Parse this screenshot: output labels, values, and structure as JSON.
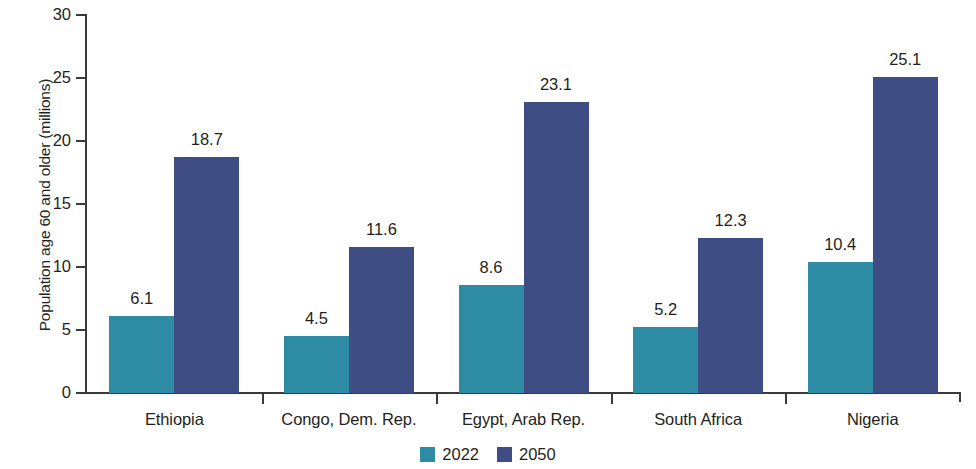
{
  "chart_data": {
    "type": "bar",
    "title": "",
    "subtitle": "",
    "xlabel": "",
    "ylabel": "Population age 60 and older (millions)",
    "categories": [
      "Ethiopia",
      "Congo, Dem. Rep.",
      "Egypt, Arab Rep.",
      "South Africa",
      "Nigeria"
    ],
    "series": [
      {
        "name": "2022",
        "color": "#2d8ba3",
        "values": [
          6.1,
          4.5,
          8.6,
          5.2,
          10.4
        ],
        "value_labels": [
          "6.1",
          "4.5",
          "8.6",
          "5.2",
          "10.4"
        ]
      },
      {
        "name": "2050",
        "color": "#3e4e84",
        "values": [
          18.7,
          11.6,
          23.1,
          12.3,
          25.1
        ],
        "value_labels": [
          "18.7",
          "11.6",
          "23.1",
          "12.3",
          "25.1"
        ]
      }
    ],
    "ylim": [
      0,
      30
    ],
    "yticks": [
      0,
      5,
      10,
      15,
      20,
      25,
      30
    ],
    "ytick_labels": [
      "0",
      "5",
      "10",
      "15",
      "20",
      "25",
      "30"
    ],
    "grid": false,
    "legend_position": "bottom-center"
  },
  "legend": {
    "entries": [
      {
        "label": "2022",
        "color": "#2d8ba3"
      },
      {
        "label": "2050",
        "color": "#3e4e84"
      }
    ]
  },
  "axis": {
    "line_color": "#3a3a3a"
  }
}
